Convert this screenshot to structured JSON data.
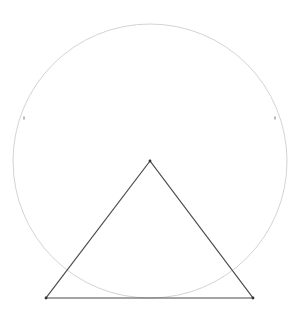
{
  "canvas": {
    "width": 298,
    "height": 318,
    "background": "#ffffff"
  },
  "circle": {
    "cx": 150,
    "cy": 161,
    "r": 137,
    "stroke": "#c8c8c8",
    "stroke_width": 0.8,
    "ticks": [
      {
        "x": 24,
        "y": 118
      },
      {
        "x": 275,
        "y": 118
      }
    ]
  },
  "triangle": {
    "apex": {
      "x": 150,
      "y": 161
    },
    "base_left": {
      "x": 46,
      "y": 298
    },
    "base_right": {
      "x": 253,
      "y": 298
    },
    "stroke": "#4a4a4a",
    "stroke_width": 1.2,
    "vertex_color": "#333333"
  }
}
